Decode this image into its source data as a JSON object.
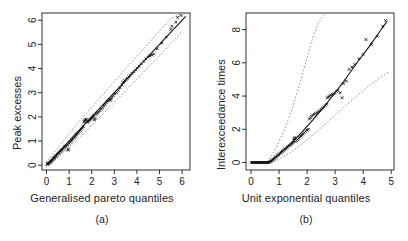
{
  "figure": {
    "background": "#ffffff",
    "foreground": "#1a1a1a",
    "point_color": "#111111",
    "line_color": "#111111",
    "band_color": "#8c8c8c"
  },
  "panels": [
    {
      "caption": "(a)",
      "xlabel": "Generalised pareto quantiles",
      "ylabel": "Peak excesses",
      "xticks": [
        "0",
        "1",
        "2",
        "3",
        "4",
        "5",
        "6"
      ],
      "yticks": [
        "0",
        "1",
        "2",
        "3",
        "4",
        "5",
        "6"
      ]
    },
    {
      "caption": "(b)",
      "xlabel": "Unit exponential quantiles",
      "ylabel": "Interexceedance times",
      "xticks": [
        "0",
        "1",
        "2",
        "3",
        "4",
        "5"
      ],
      "yticks": [
        "0",
        "2",
        "4",
        "6",
        "8"
      ]
    }
  ],
  "chart_data": [
    {
      "type": "scatter",
      "panel": "(a)",
      "title": "",
      "xlabel": "Generalised pareto quantiles",
      "ylabel": "Peak excesses",
      "xlim": [
        -0.2,
        6.35
      ],
      "ylim": [
        -0.2,
        6.3
      ],
      "xticks": [
        0,
        1,
        2,
        3,
        4,
        5,
        6
      ],
      "yticks": [
        0,
        1,
        2,
        3,
        4,
        5,
        6
      ],
      "grid": false,
      "legend": null,
      "marker": "cross",
      "reference_line": {
        "name": "identity",
        "style": "solid",
        "x": [
          0.0,
          6.15
        ],
        "y": [
          0.0,
          6.15
        ]
      },
      "confidence_bands": [
        {
          "name": "upper",
          "style": "dotted",
          "x": [
            0.0,
            0.5,
            1.0,
            1.5,
            2.0,
            2.5,
            3.0,
            3.5,
            4.0,
            4.5,
            5.0,
            5.5,
            6.0
          ],
          "y": [
            0.1,
            0.72,
            1.3,
            1.86,
            2.4,
            2.93,
            3.46,
            3.99,
            4.51,
            5.03,
            5.56,
            6.08,
            6.3
          ]
        },
        {
          "name": "lower",
          "style": "dotted",
          "x": [
            0.0,
            0.5,
            1.0,
            1.5,
            2.0,
            2.5,
            3.0,
            3.5,
            4.0,
            4.5,
            5.0,
            5.5,
            6.0
          ],
          "y": [
            -0.08,
            0.32,
            0.74,
            1.19,
            1.65,
            2.12,
            2.6,
            3.08,
            3.56,
            4.05,
            4.54,
            5.03,
            5.52
          ]
        }
      ],
      "points": [
        [
          0.03,
          0.04
        ],
        [
          0.06,
          0.05
        ],
        [
          0.09,
          0.07
        ],
        [
          0.12,
          0.09
        ],
        [
          0.15,
          0.11
        ],
        [
          0.18,
          0.14
        ],
        [
          0.21,
          0.16
        ],
        [
          0.24,
          0.2
        ],
        [
          0.27,
          0.22
        ],
        [
          0.3,
          0.26
        ],
        [
          0.33,
          0.29
        ],
        [
          0.36,
          0.31
        ],
        [
          0.39,
          0.35
        ],
        [
          0.42,
          0.38
        ],
        [
          0.45,
          0.41
        ],
        [
          0.48,
          0.44
        ],
        [
          0.52,
          0.48
        ],
        [
          0.55,
          0.5
        ],
        [
          0.58,
          0.54
        ],
        [
          0.62,
          0.57
        ],
        [
          0.65,
          0.6
        ],
        [
          0.68,
          0.63
        ],
        [
          0.72,
          0.66
        ],
        [
          0.75,
          0.7
        ],
        [
          0.79,
          0.73
        ],
        [
          0.82,
          0.76
        ],
        [
          0.86,
          0.79
        ],
        [
          0.9,
          0.82
        ],
        [
          0.93,
          0.86
        ],
        [
          0.95,
          0.62
        ],
        [
          0.97,
          0.66
        ],
        [
          1.0,
          0.9
        ],
        [
          1.04,
          0.95
        ],
        [
          1.08,
          0.99
        ],
        [
          1.12,
          1.03
        ],
        [
          1.16,
          1.08
        ],
        [
          1.2,
          1.12
        ],
        [
          1.24,
          1.16
        ],
        [
          1.28,
          1.2
        ],
        [
          1.32,
          1.25
        ],
        [
          1.36,
          1.3
        ],
        [
          1.41,
          1.34
        ],
        [
          1.45,
          1.4
        ],
        [
          1.5,
          1.44
        ],
        [
          1.54,
          1.49
        ],
        [
          1.59,
          1.54
        ],
        [
          1.63,
          1.6
        ],
        [
          1.65,
          1.78
        ],
        [
          1.68,
          1.82
        ],
        [
          1.7,
          1.85
        ],
        [
          1.73,
          1.88
        ],
        [
          1.76,
          1.9
        ],
        [
          1.8,
          1.77
        ],
        [
          1.84,
          1.8
        ],
        [
          1.88,
          1.84
        ],
        [
          1.92,
          1.88
        ],
        [
          1.97,
          1.92
        ],
        [
          2.0,
          1.95
        ],
        [
          2.05,
          1.99
        ],
        [
          2.1,
          2.05
        ],
        [
          2.12,
          1.88
        ],
        [
          2.15,
          1.93
        ],
        [
          2.2,
          2.1
        ],
        [
          2.25,
          2.15
        ],
        [
          2.3,
          2.2
        ],
        [
          2.36,
          2.26
        ],
        [
          2.42,
          2.32
        ],
        [
          2.48,
          2.38
        ],
        [
          2.54,
          2.45
        ],
        [
          2.6,
          2.52
        ],
        [
          2.66,
          2.6
        ],
        [
          2.72,
          2.66
        ],
        [
          2.78,
          2.72
        ],
        [
          2.82,
          2.68
        ],
        [
          2.85,
          2.73
        ],
        [
          2.9,
          2.8
        ],
        [
          2.96,
          2.88
        ],
        [
          3.02,
          2.95
        ],
        [
          3.1,
          3.0
        ],
        [
          3.18,
          3.1
        ],
        [
          3.26,
          3.2
        ],
        [
          3.34,
          3.32
        ],
        [
          3.38,
          3.42
        ],
        [
          3.42,
          3.45
        ],
        [
          3.46,
          3.5
        ],
        [
          3.52,
          3.55
        ],
        [
          3.58,
          3.6
        ],
        [
          3.64,
          3.66
        ],
        [
          3.7,
          3.72
        ],
        [
          3.78,
          3.8
        ],
        [
          3.86,
          3.88
        ],
        [
          3.94,
          3.95
        ],
        [
          4.02,
          4.02
        ],
        [
          4.1,
          4.1
        ],
        [
          4.2,
          4.2
        ],
        [
          4.3,
          4.3
        ],
        [
          4.4,
          4.4
        ],
        [
          4.5,
          4.48
        ],
        [
          4.58,
          4.52
        ],
        [
          4.66,
          4.56
        ],
        [
          4.74,
          4.6
        ],
        [
          4.9,
          4.82
        ],
        [
          5.1,
          5.05
        ],
        [
          5.3,
          5.3
        ],
        [
          5.5,
          5.62
        ],
        [
          5.55,
          5.75
        ],
        [
          5.72,
          5.92
        ],
        [
          5.8,
          6.12
        ],
        [
          5.95,
          6.2
        ]
      ]
    },
    {
      "type": "scatter",
      "panel": "(b)",
      "title": "",
      "xlabel": "Unit exponential quantiles",
      "ylabel": "Interexceedance times",
      "xlim": [
        -0.18,
        5.1
      ],
      "ylim": [
        -0.45,
        9.0
      ],
      "xticks": [
        0,
        1,
        2,
        3,
        4,
        5
      ],
      "yticks": [
        0,
        2,
        4,
        6,
        8
      ],
      "grid": false,
      "legend": null,
      "marker": "cross",
      "reference_line": {
        "name": "fitted",
        "style": "solid",
        "x": [
          0.0,
          0.6,
          0.8,
          1.0,
          1.4,
          1.8,
          2.2,
          2.6,
          3.0,
          3.4,
          3.8,
          4.2,
          4.6,
          4.85
        ],
        "y": [
          0.0,
          0.02,
          0.2,
          0.5,
          1.1,
          1.8,
          2.55,
          3.35,
          4.2,
          5.1,
          6.05,
          6.95,
          7.9,
          8.5
        ]
      },
      "confidence_bands": [
        {
          "name": "upper",
          "style": "dotted",
          "x": [
            0.6,
            0.9,
            1.2,
            1.5,
            1.8,
            2.0,
            2.2,
            2.4,
            2.6
          ],
          "y": [
            0.05,
            0.9,
            2.0,
            3.4,
            5.1,
            6.3,
            7.5,
            8.4,
            8.9
          ]
        },
        {
          "name": "lower",
          "style": "dotted",
          "x": [
            0.6,
            1.0,
            1.4,
            1.8,
            2.2,
            2.6,
            3.0,
            3.4,
            3.8,
            4.2,
            4.6,
            4.9
          ],
          "y": [
            -0.05,
            0.18,
            0.6,
            1.1,
            1.65,
            2.25,
            2.85,
            3.45,
            4.05,
            4.6,
            5.1,
            5.45
          ]
        }
      ],
      "points": [
        [
          0.02,
          0.0
        ],
        [
          0.05,
          0.0
        ],
        [
          0.08,
          0.0
        ],
        [
          0.11,
          0.0
        ],
        [
          0.14,
          0.0
        ],
        [
          0.17,
          0.0
        ],
        [
          0.2,
          0.0
        ],
        [
          0.23,
          0.0
        ],
        [
          0.26,
          0.0
        ],
        [
          0.29,
          0.0
        ],
        [
          0.32,
          0.0
        ],
        [
          0.35,
          0.0
        ],
        [
          0.38,
          0.0
        ],
        [
          0.41,
          0.0
        ],
        [
          0.44,
          0.0
        ],
        [
          0.47,
          0.0
        ],
        [
          0.5,
          0.0
        ],
        [
          0.53,
          0.0
        ],
        [
          0.56,
          0.0
        ],
        [
          0.59,
          0.0
        ],
        [
          0.62,
          0.0
        ],
        [
          0.65,
          0.02
        ],
        [
          0.68,
          0.05
        ],
        [
          0.71,
          0.08
        ],
        [
          0.74,
          0.12
        ],
        [
          0.77,
          0.16
        ],
        [
          0.8,
          0.2
        ],
        [
          0.83,
          0.25
        ],
        [
          0.86,
          0.3
        ],
        [
          0.89,
          0.34
        ],
        [
          0.92,
          0.38
        ],
        [
          0.95,
          0.43
        ],
        [
          0.98,
          0.47
        ],
        [
          1.01,
          0.52
        ],
        [
          1.05,
          0.57
        ],
        [
          1.08,
          0.62
        ],
        [
          1.12,
          0.67
        ],
        [
          1.15,
          0.72
        ],
        [
          1.19,
          0.77
        ],
        [
          1.22,
          0.82
        ],
        [
          1.26,
          0.87
        ],
        [
          1.3,
          0.93
        ],
        [
          1.34,
          0.98
        ],
        [
          1.38,
          1.03
        ],
        [
          1.42,
          1.08
        ],
        [
          1.46,
          1.14
        ],
        [
          1.5,
          1.2
        ],
        [
          1.52,
          1.35
        ],
        [
          1.54,
          1.45
        ],
        [
          1.56,
          1.5
        ],
        [
          1.58,
          1.26
        ],
        [
          1.62,
          1.32
        ],
        [
          1.66,
          1.38
        ],
        [
          1.7,
          1.45
        ],
        [
          1.74,
          1.52
        ],
        [
          1.78,
          1.6
        ],
        [
          1.82,
          1.66
        ],
        [
          1.86,
          1.72
        ],
        [
          1.9,
          1.8
        ],
        [
          1.95,
          1.88
        ],
        [
          2.0,
          1.95
        ],
        [
          2.05,
          2.0
        ],
        [
          2.08,
          2.62
        ],
        [
          2.12,
          2.7
        ],
        [
          2.16,
          2.78
        ],
        [
          2.2,
          2.85
        ],
        [
          2.25,
          2.9
        ],
        [
          2.3,
          2.95
        ],
        [
          2.35,
          3.0
        ],
        [
          2.4,
          3.05
        ],
        [
          2.45,
          3.12
        ],
        [
          2.5,
          3.2
        ],
        [
          2.55,
          3.28
        ],
        [
          2.6,
          3.35
        ],
        [
          2.65,
          3.42
        ],
        [
          2.7,
          3.5
        ],
        [
          2.72,
          3.9
        ],
        [
          2.76,
          3.95
        ],
        [
          2.8,
          4.0
        ],
        [
          2.85,
          4.05
        ],
        [
          2.9,
          4.1
        ],
        [
          2.95,
          4.15
        ],
        [
          3.0,
          4.2
        ],
        [
          3.05,
          4.28
        ],
        [
          3.1,
          4.35
        ],
        [
          3.18,
          4.2
        ],
        [
          3.25,
          3.9
        ],
        [
          3.3,
          4.75
        ],
        [
          3.4,
          4.9
        ],
        [
          3.5,
          5.6
        ],
        [
          3.6,
          5.75
        ],
        [
          3.7,
          5.9
        ],
        [
          3.85,
          6.25
        ],
        [
          4.0,
          6.5
        ],
        [
          4.1,
          7.4
        ],
        [
          4.3,
          7.1
        ],
        [
          4.5,
          7.6
        ],
        [
          4.7,
          8.2
        ],
        [
          4.8,
          8.55
        ]
      ]
    }
  ]
}
